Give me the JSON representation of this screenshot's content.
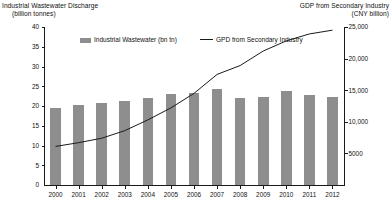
{
  "chart_data": {
    "type": "bar",
    "title": "",
    "subtitle": "",
    "categories": [
      "2000",
      "2001",
      "2002",
      "2003",
      "2004",
      "2005",
      "2006",
      "2007",
      "2008",
      "2009",
      "2010",
      "2011",
      "2012"
    ],
    "series": [
      {
        "name": "Industrial Wastewater (bn tn)",
        "type": "bar",
        "axis": "left",
        "color": "#8e8e8e",
        "values": [
          19.4,
          20.3,
          20.7,
          21.2,
          22.1,
          23.1,
          23.3,
          24.2,
          22.0,
          22.3,
          23.7,
          22.7,
          22.2
        ]
      },
      {
        "name": "GPD from Secondary Industry",
        "type": "line",
        "axis": "right",
        "color": "#1a1a1a",
        "values": [
          6100,
          6700,
          7400,
          8600,
          10300,
          12200,
          14500,
          17500,
          18900,
          21200,
          22800,
          23900,
          24500
        ]
      }
    ],
    "left_axis": {
      "label": "Industrial Wastewater Discharge (billion tonnes)",
      "label_line1": "Industrial Wastewater Discharge",
      "label_line2": "(billion tonnes)",
      "ticks": [
        "40",
        "35",
        "30",
        "25",
        "20",
        "15",
        "10",
        "5",
        "0"
      ],
      "tick_values": [
        40,
        35,
        30,
        25,
        20,
        15,
        10,
        5,
        0
      ],
      "ylim": [
        0,
        40
      ]
    },
    "right_axis": {
      "label": "GDP from Secondary Industry (CNY billion)",
      "label_line1": "GDP from Secondary Industry",
      "label_line2": "(CNY billion)",
      "ticks": [
        "25,000",
        "20,000",
        "15,000",
        "10,000",
        "5000"
      ],
      "tick_values": [
        25000,
        20000,
        15000,
        10000,
        5000
      ],
      "ylim": [
        0,
        25000
      ]
    },
    "xlabel": "",
    "grid": false,
    "legend_position": "top"
  },
  "legend": {
    "items": [
      {
        "label": "Industrial Wastewater (bn tn)",
        "marker": "bar-swatch-icon"
      },
      {
        "label": "GPD from Secondary Industry",
        "marker": "line-swatch-icon"
      }
    ]
  }
}
